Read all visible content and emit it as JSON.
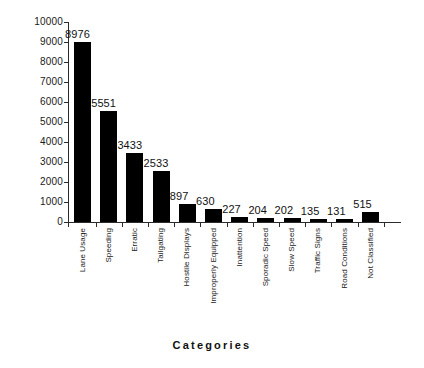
{
  "chart_data": {
    "type": "bar",
    "title": "",
    "xlabel": "Categories",
    "ylabel": "",
    "ylim": [
      0,
      10000
    ],
    "yticks": [
      10000,
      9000,
      8000,
      7000,
      6000,
      5000,
      4000,
      3000,
      2000,
      1000,
      0
    ],
    "grid": false,
    "legend": null,
    "bar_color": "#000000",
    "show_value_labels": true,
    "categories": [
      "Lane Usage",
      "Speeding",
      "Erratic",
      "Tailgating",
      "Hostile Displays",
      "Improperly Equipped",
      "Inattention",
      "Sporadic Speed",
      "Slow Speed",
      "Traffic Signs",
      "Road Conditions",
      "Not Classified"
    ],
    "values": [
      8976,
      5551,
      3433,
      2533,
      897,
      630,
      227,
      204,
      202,
      135,
      131,
      515
    ]
  }
}
